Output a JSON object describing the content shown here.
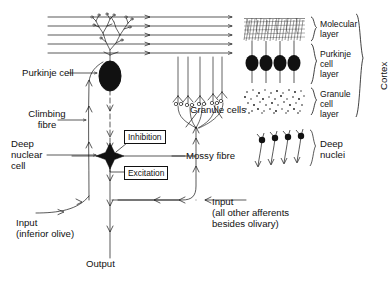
{
  "figure": {
    "ink_color": "#111111",
    "background": "#ffffff"
  },
  "labels": {
    "purkinje_cell": "Purkinje cell",
    "climbing_fibre": "Climbing\nfibre",
    "deep_nuclear_cell": "Deep\nnuclear\ncell",
    "input_inferior_olive": "Input\n(inferior olive)",
    "output": "Output",
    "granule_cells": "Granule cells",
    "mossy_fibre": "Mossy fibre",
    "input_other_afferents": "Input\n(all other afferents\nbesides olivary)",
    "inhibition": "Inhibition",
    "excitation": "Excitation",
    "deep_nuclei": "Deep\nnuclei"
  },
  "inset_cortex": {
    "cortex": "Cortex",
    "molecular_layer": "Molecular\nlayer",
    "purkinje_cell_layer": "Purkinje\ncell\nlayer",
    "granule_cell_layer": "Granule\ncell\nlayer",
    "purkinje_cell_count": 4
  },
  "inset_deep_nuclei": {
    "label": "Deep\nnuclei",
    "cell_count": 4
  },
  "structures": {
    "parallel_fibre_count": 5,
    "granule_cell_count": 4,
    "purkinje_soma_shape": "filled-ellipse",
    "deep_nuclear_cell_shape": "filled-four-point-star"
  },
  "icons": {
    "arrowhead": "arrowhead-icon",
    "purkinje_soma": "purkinje-soma-icon",
    "star_cell": "deep-nuclear-star-icon",
    "brace": "curly-brace-icon"
  }
}
